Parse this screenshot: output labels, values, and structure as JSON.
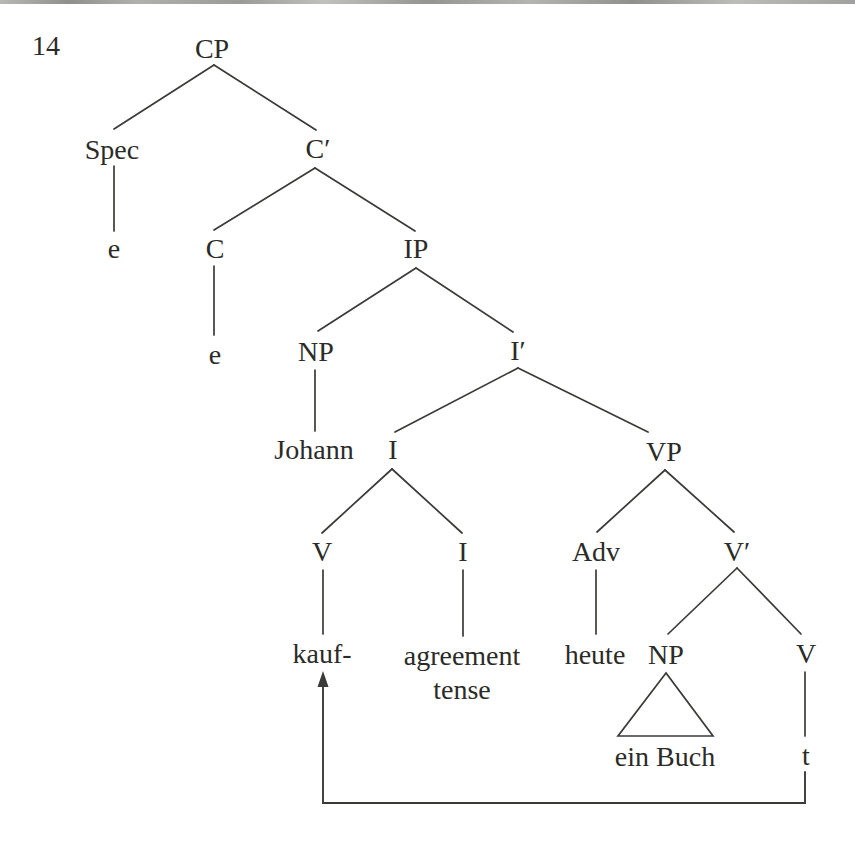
{
  "page": {
    "number": "14"
  },
  "colors": {
    "ink": "#2b2b28",
    "line": "#3a3a36",
    "top_rule": "#a5a5a3",
    "background": "#ffffff"
  },
  "tree": {
    "nodes": {
      "cp": {
        "label": "CP"
      },
      "spec": {
        "label": "Spec"
      },
      "spec_trace": {
        "label": "e"
      },
      "c_bar": {
        "label": "C′"
      },
      "c": {
        "label": "C"
      },
      "c_trace": {
        "label": "e"
      },
      "ip": {
        "label": "IP"
      },
      "np_subject": {
        "label": "NP"
      },
      "i_bar": {
        "label": "I′"
      },
      "johann": {
        "label": "Johann"
      },
      "i": {
        "label": "I"
      },
      "vp": {
        "label": "VP"
      },
      "v_head": {
        "label": "V"
      },
      "i_lower": {
        "label": "I"
      },
      "adv": {
        "label": "Adv"
      },
      "v_bar": {
        "label": "V′"
      },
      "kauf": {
        "label": "kauf-"
      },
      "i_lower_content": {
        "label": "agreement\ntense"
      },
      "heute": {
        "label": "heute"
      },
      "np_object": {
        "label": "NP"
      },
      "v_trace_head": {
        "label": "V"
      },
      "ein_buch": {
        "label": "ein Buch"
      },
      "trace": {
        "label": "t"
      }
    }
  }
}
